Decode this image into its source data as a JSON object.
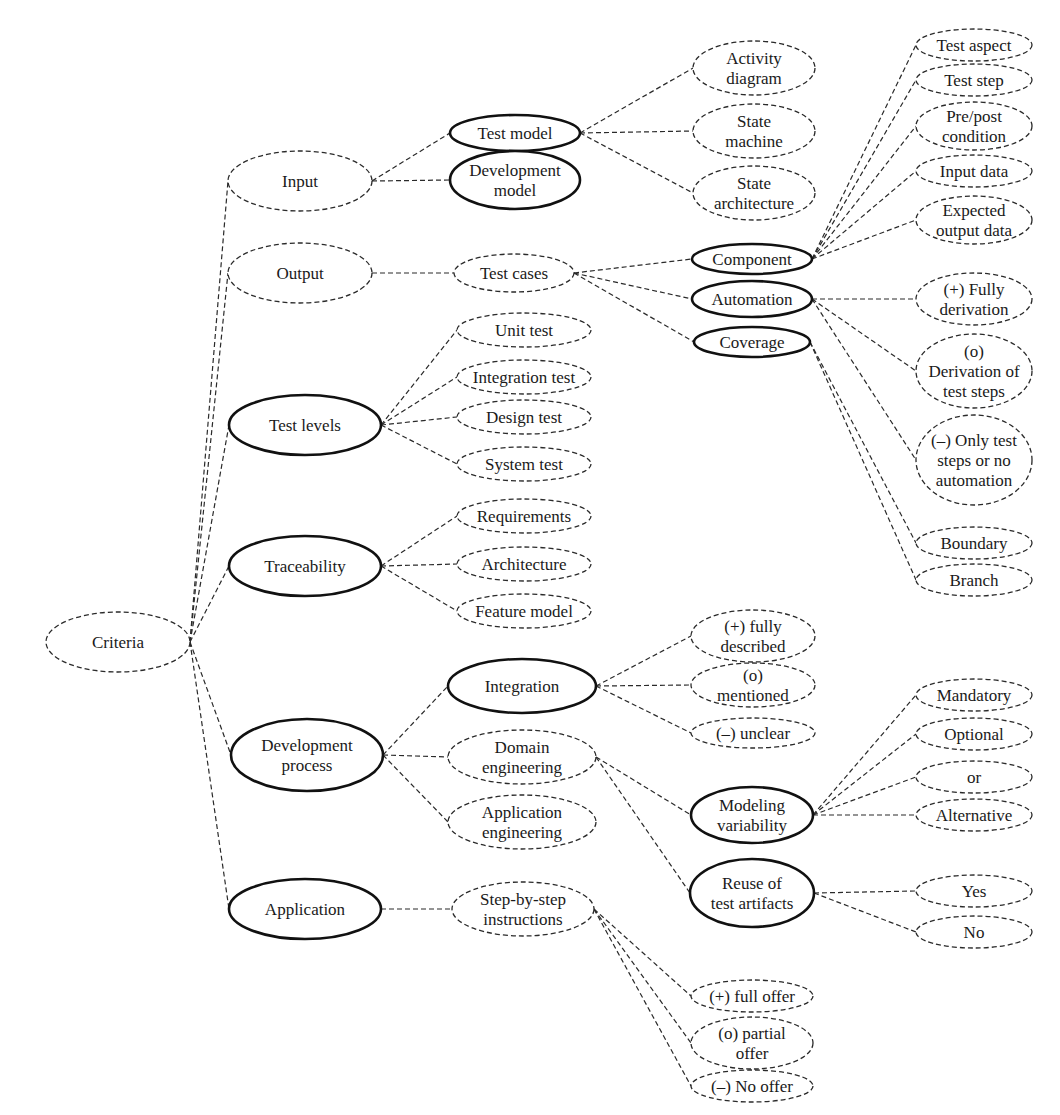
{
  "diagram": {
    "colors": {
      "stroke": "#2a2a2a",
      "text": "#1a1a1a",
      "background": "#ffffff"
    },
    "nodes": [
      {
        "id": "criteria",
        "lines": [
          "Criteria"
        ],
        "cx": 118,
        "cy": 642,
        "rx": 72,
        "ry": 30,
        "style": "dashed"
      },
      {
        "id": "input",
        "lines": [
          "Input"
        ],
        "cx": 300,
        "cy": 181,
        "rx": 72,
        "ry": 30,
        "style": "dashed"
      },
      {
        "id": "output",
        "lines": [
          "Output"
        ],
        "cx": 300,
        "cy": 273,
        "rx": 72,
        "ry": 30,
        "style": "dashed"
      },
      {
        "id": "test-levels",
        "lines": [
          "Test levels"
        ],
        "cx": 305,
        "cy": 425,
        "rx": 76,
        "ry": 30,
        "style": "solid"
      },
      {
        "id": "traceability",
        "lines": [
          "Traceability"
        ],
        "cx": 305,
        "cy": 566,
        "rx": 76,
        "ry": 30,
        "style": "solid"
      },
      {
        "id": "development-process",
        "lines": [
          "Development",
          "process"
        ],
        "cx": 307,
        "cy": 755,
        "rx": 76,
        "ry": 36,
        "style": "solid"
      },
      {
        "id": "application",
        "lines": [
          "Application"
        ],
        "cx": 305,
        "cy": 909,
        "rx": 76,
        "ry": 30,
        "style": "solid"
      },
      {
        "id": "test-model",
        "lines": [
          "Test model"
        ],
        "cx": 515,
        "cy": 133,
        "rx": 65,
        "ry": 18,
        "style": "solid"
      },
      {
        "id": "development-model",
        "lines": [
          "Development",
          "model"
        ],
        "cx": 515,
        "cy": 180,
        "rx": 65,
        "ry": 29,
        "style": "solid"
      },
      {
        "id": "test-cases",
        "lines": [
          "Test cases"
        ],
        "cx": 514,
        "cy": 273,
        "rx": 60,
        "ry": 19,
        "style": "dashed"
      },
      {
        "id": "activity-diagram",
        "lines": [
          "Activity",
          "diagram"
        ],
        "cx": 754,
        "cy": 68,
        "rx": 61,
        "ry": 27,
        "style": "dashed"
      },
      {
        "id": "state-machine",
        "lines": [
          "State",
          "machine"
        ],
        "cx": 754,
        "cy": 131,
        "rx": 61,
        "ry": 27,
        "style": "dashed"
      },
      {
        "id": "state-architecture",
        "lines": [
          "State",
          "architecture"
        ],
        "cx": 754,
        "cy": 193,
        "rx": 61,
        "ry": 27,
        "style": "dashed"
      },
      {
        "id": "unit-test",
        "lines": [
          "Unit test"
        ],
        "cx": 524,
        "cy": 330,
        "rx": 67,
        "ry": 17,
        "style": "dashed"
      },
      {
        "id": "integration-test",
        "lines": [
          "Integration test"
        ],
        "cx": 524,
        "cy": 377,
        "rx": 67,
        "ry": 17,
        "style": "dashed"
      },
      {
        "id": "design-test",
        "lines": [
          "Design test"
        ],
        "cx": 524,
        "cy": 417,
        "rx": 67,
        "ry": 17,
        "style": "dashed"
      },
      {
        "id": "system-test",
        "lines": [
          "System test"
        ],
        "cx": 524,
        "cy": 464,
        "rx": 67,
        "ry": 17,
        "style": "dashed"
      },
      {
        "id": "requirements",
        "lines": [
          "Requirements"
        ],
        "cx": 524,
        "cy": 516,
        "rx": 67,
        "ry": 17,
        "style": "dashed"
      },
      {
        "id": "architecture",
        "lines": [
          "Architecture"
        ],
        "cx": 524,
        "cy": 564,
        "rx": 67,
        "ry": 17,
        "style": "dashed"
      },
      {
        "id": "feature-model",
        "lines": [
          "Feature model"
        ],
        "cx": 524,
        "cy": 611,
        "rx": 67,
        "ry": 17,
        "style": "dashed"
      },
      {
        "id": "component",
        "lines": [
          "Component"
        ],
        "cx": 752,
        "cy": 259,
        "rx": 60,
        "ry": 15,
        "style": "solid"
      },
      {
        "id": "automation",
        "lines": [
          "Automation"
        ],
        "cx": 752,
        "cy": 299,
        "rx": 60,
        "ry": 18,
        "style": "solid"
      },
      {
        "id": "coverage",
        "lines": [
          "Coverage"
        ],
        "cx": 752,
        "cy": 342,
        "rx": 58,
        "ry": 15,
        "style": "solid"
      },
      {
        "id": "test-aspect",
        "lines": [
          "Test aspect"
        ],
        "cx": 974,
        "cy": 45,
        "rx": 58,
        "ry": 16,
        "style": "dashed"
      },
      {
        "id": "test-step",
        "lines": [
          "Test step"
        ],
        "cx": 974,
        "cy": 80,
        "rx": 58,
        "ry": 16,
        "style": "dashed"
      },
      {
        "id": "pre-post-condition",
        "lines": [
          "Pre/post",
          "condition"
        ],
        "cx": 974,
        "cy": 126,
        "rx": 58,
        "ry": 24,
        "style": "dashed"
      },
      {
        "id": "input-data",
        "lines": [
          "Input data"
        ],
        "cx": 974,
        "cy": 171,
        "rx": 58,
        "ry": 16,
        "style": "dashed"
      },
      {
        "id": "expected-output-data",
        "lines": [
          "Expected",
          "output data"
        ],
        "cx": 974,
        "cy": 220,
        "rx": 58,
        "ry": 24,
        "style": "dashed"
      },
      {
        "id": "fully-derivation",
        "lines": [
          "(+) Fully",
          "derivation"
        ],
        "cx": 974,
        "cy": 299,
        "rx": 58,
        "ry": 26,
        "style": "dashed"
      },
      {
        "id": "derivation-of-test-steps",
        "lines": [
          "(o)",
          "Derivation of",
          "test steps"
        ],
        "cx": 974,
        "cy": 371,
        "rx": 58,
        "ry": 37,
        "style": "dashed"
      },
      {
        "id": "only-test-steps",
        "lines": [
          "(–) Only test",
          "steps or no",
          "automation"
        ],
        "cx": 974,
        "cy": 460,
        "rx": 58,
        "ry": 45,
        "style": "dashed"
      },
      {
        "id": "boundary",
        "lines": [
          "Boundary"
        ],
        "cx": 974,
        "cy": 543,
        "rx": 58,
        "ry": 16,
        "style": "dashed"
      },
      {
        "id": "branch",
        "lines": [
          "Branch"
        ],
        "cx": 974,
        "cy": 580,
        "rx": 58,
        "ry": 16,
        "style": "dashed"
      },
      {
        "id": "integration",
        "lines": [
          "Integration"
        ],
        "cx": 522,
        "cy": 686,
        "rx": 74,
        "ry": 27,
        "style": "solid"
      },
      {
        "id": "domain-engineering",
        "lines": [
          "Domain",
          "engineering"
        ],
        "cx": 522,
        "cy": 757,
        "rx": 74,
        "ry": 27,
        "style": "dashed"
      },
      {
        "id": "application-engineering",
        "lines": [
          "Application",
          "engineering"
        ],
        "cx": 522,
        "cy": 822,
        "rx": 74,
        "ry": 27,
        "style": "dashed"
      },
      {
        "id": "step-by-step-instructions",
        "lines": [
          "Step-by-step",
          "instructions"
        ],
        "cx": 523,
        "cy": 909,
        "rx": 71,
        "ry": 27,
        "style": "dashed"
      },
      {
        "id": "fully-described",
        "lines": [
          "(+) fully",
          "described"
        ],
        "cx": 753,
        "cy": 636,
        "rx": 62,
        "ry": 26,
        "style": "dashed"
      },
      {
        "id": "mentioned",
        "lines": [
          "(o)",
          "mentioned"
        ],
        "cx": 753,
        "cy": 685,
        "rx": 62,
        "ry": 22,
        "style": "dashed"
      },
      {
        "id": "unclear",
        "lines": [
          "(–) unclear"
        ],
        "cx": 753,
        "cy": 733,
        "rx": 62,
        "ry": 15,
        "style": "dashed"
      },
      {
        "id": "modeling-variability",
        "lines": [
          "Modeling",
          "variability"
        ],
        "cx": 752,
        "cy": 815,
        "rx": 61,
        "ry": 28,
        "style": "solid"
      },
      {
        "id": "reuse-of-test-artifacts",
        "lines": [
          "Reuse of",
          "test artifacts"
        ],
        "cx": 752,
        "cy": 893,
        "rx": 62,
        "ry": 34,
        "style": "solid"
      },
      {
        "id": "mandatory",
        "lines": [
          "Mandatory"
        ],
        "cx": 974,
        "cy": 695,
        "rx": 58,
        "ry": 16,
        "style": "dashed"
      },
      {
        "id": "optional",
        "lines": [
          "Optional"
        ],
        "cx": 974,
        "cy": 734,
        "rx": 58,
        "ry": 16,
        "style": "dashed"
      },
      {
        "id": "or",
        "lines": [
          "or"
        ],
        "cx": 974,
        "cy": 777,
        "rx": 58,
        "ry": 16,
        "style": "dashed"
      },
      {
        "id": "alternative",
        "lines": [
          "Alternative"
        ],
        "cx": 974,
        "cy": 815,
        "rx": 58,
        "ry": 16,
        "style": "dashed"
      },
      {
        "id": "yes",
        "lines": [
          "Yes"
        ],
        "cx": 974,
        "cy": 891,
        "rx": 58,
        "ry": 16,
        "style": "dashed"
      },
      {
        "id": "no",
        "lines": [
          "No"
        ],
        "cx": 974,
        "cy": 932,
        "rx": 58,
        "ry": 16,
        "style": "dashed"
      },
      {
        "id": "full-offer",
        "lines": [
          "(+) full offer"
        ],
        "cx": 752,
        "cy": 996,
        "rx": 61,
        "ry": 16,
        "style": "dashed"
      },
      {
        "id": "partial-offer",
        "lines": [
          "(o) partial",
          "offer"
        ],
        "cx": 752,
        "cy": 1043,
        "rx": 61,
        "ry": 26,
        "style": "dashed"
      },
      {
        "id": "no-offer",
        "lines": [
          "(–) No offer"
        ],
        "cx": 752,
        "cy": 1086,
        "rx": 61,
        "ry": 16,
        "style": "dashed"
      }
    ],
    "edges": [
      [
        "criteria",
        "input"
      ],
      [
        "criteria",
        "output"
      ],
      [
        "criteria",
        "test-levels"
      ],
      [
        "criteria",
        "traceability"
      ],
      [
        "criteria",
        "development-process"
      ],
      [
        "criteria",
        "application"
      ],
      [
        "input",
        "test-model"
      ],
      [
        "input",
        "development-model"
      ],
      [
        "test-model",
        "activity-diagram"
      ],
      [
        "test-model",
        "state-machine"
      ],
      [
        "test-model",
        "state-architecture"
      ],
      [
        "output",
        "test-cases"
      ],
      [
        "test-cases",
        "component"
      ],
      [
        "test-cases",
        "automation"
      ],
      [
        "test-cases",
        "coverage"
      ],
      [
        "component",
        "test-aspect"
      ],
      [
        "component",
        "test-step"
      ],
      [
        "component",
        "pre-post-condition"
      ],
      [
        "component",
        "input-data"
      ],
      [
        "component",
        "expected-output-data"
      ],
      [
        "automation",
        "fully-derivation"
      ],
      [
        "automation",
        "derivation-of-test-steps"
      ],
      [
        "automation",
        "only-test-steps"
      ],
      [
        "coverage",
        "boundary"
      ],
      [
        "coverage",
        "branch"
      ],
      [
        "test-levels",
        "unit-test"
      ],
      [
        "test-levels",
        "integration-test"
      ],
      [
        "test-levels",
        "design-test"
      ],
      [
        "test-levels",
        "system-test"
      ],
      [
        "traceability",
        "requirements"
      ],
      [
        "traceability",
        "architecture"
      ],
      [
        "traceability",
        "feature-model"
      ],
      [
        "development-process",
        "integration"
      ],
      [
        "development-process",
        "domain-engineering"
      ],
      [
        "development-process",
        "application-engineering"
      ],
      [
        "integration",
        "fully-described"
      ],
      [
        "integration",
        "mentioned"
      ],
      [
        "integration",
        "unclear"
      ],
      [
        "domain-engineering",
        "modeling-variability"
      ],
      [
        "domain-engineering",
        "reuse-of-test-artifacts"
      ],
      [
        "modeling-variability",
        "mandatory"
      ],
      [
        "modeling-variability",
        "optional"
      ],
      [
        "modeling-variability",
        "or"
      ],
      [
        "modeling-variability",
        "alternative"
      ],
      [
        "reuse-of-test-artifacts",
        "yes"
      ],
      [
        "reuse-of-test-artifacts",
        "no"
      ],
      [
        "application",
        "step-by-step-instructions"
      ],
      [
        "step-by-step-instructions",
        "full-offer"
      ],
      [
        "step-by-step-instructions",
        "partial-offer"
      ],
      [
        "step-by-step-instructions",
        "no-offer"
      ]
    ]
  }
}
